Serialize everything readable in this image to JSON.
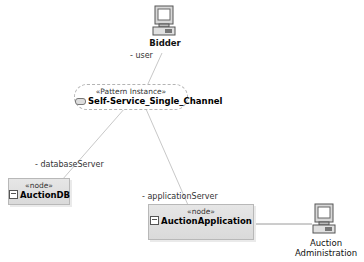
{
  "diagram": {
    "pattern_instance": {
      "stereotype": "«Pattern Instance»",
      "name": "Self-Service_Single_Channel"
    },
    "actors": [
      {
        "name": "Bidder",
        "icon": "computer-icon"
      },
      {
        "name_line1": "Auction",
        "name_line2": "Administration",
        "icon": "computer-icon"
      }
    ],
    "nodes": [
      {
        "stereotype": "«node»",
        "name": "AuctionDB",
        "icon": "node-icon"
      },
      {
        "stereotype": "«node»",
        "name": "AuctionApplication",
        "icon": "node-icon"
      }
    ],
    "roles": {
      "user": "- user",
      "database_server": "- databaseServer",
      "application_server": "- applicationServer"
    }
  },
  "colors": {
    "link": "#c8c8c8",
    "node_fill": "#e0e0e0",
    "node_border": "#b8b8b8",
    "pattern_border": "#b4b4b4"
  }
}
